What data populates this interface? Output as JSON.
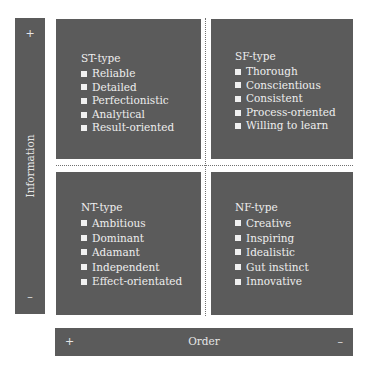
{
  "axes": {
    "vertical": {
      "label": "Information",
      "top_sign": "+",
      "bottom_sign": "–"
    },
    "horizontal": {
      "label": "Order",
      "left_sign": "+",
      "right_sign": "–"
    }
  },
  "quadrants": [
    {
      "id": "st",
      "title": "ST-type",
      "items": [
        "Reliable",
        "Detailed",
        "Perfectionistic",
        "Analytical",
        "Result-oriented"
      ]
    },
    {
      "id": "sf",
      "title": "SF-type",
      "items": [
        "Thorough",
        "Conscientious",
        "Consistent",
        "Process-oriented",
        "Willing to learn"
      ]
    },
    {
      "id": "nt",
      "title": "NT-type",
      "items": [
        "Ambitious",
        "Dominant",
        "Adamant",
        "Independent",
        "Effect-orientated"
      ]
    },
    {
      "id": "nf",
      "title": "NF-type",
      "items": [
        "Creative",
        "Inspiring",
        "Idealistic",
        "Gut instinct",
        "Innovative"
      ]
    }
  ],
  "colors": {
    "panel": "#5b5b5b",
    "text": "#eeeeee",
    "background": "#ffffff",
    "divider": "#707070"
  }
}
